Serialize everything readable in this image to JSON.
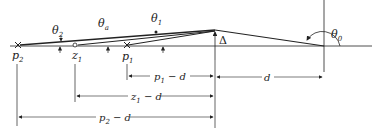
{
  "diagram": {
    "points": {
      "p2": {
        "label": "p",
        "sub": "2"
      },
      "z1": {
        "label": "z",
        "sub": "1"
      },
      "p1": {
        "label": "p",
        "sub": "1"
      }
    },
    "angles": {
      "theta2": {
        "label": "θ",
        "sub": "2"
      },
      "theta_a": {
        "label": "θ",
        "sub": "a"
      },
      "theta1": {
        "label": "θ",
        "sub": "1"
      },
      "theta0": {
        "label": "θ",
        "sub": "0"
      }
    },
    "delta_label": "Δ",
    "dimensions": {
      "p1_minus_d": {
        "a": "p",
        "sub": "1",
        "b": " − d"
      },
      "d": "d",
      "z1_minus_d": {
        "a": "z",
        "sub": "1",
        "b": " − d"
      },
      "p2_minus_d": {
        "a": "p",
        "sub": "2",
        "b": " − d"
      }
    },
    "colors": {
      "ink": "#222222",
      "background": "#ffffff"
    }
  }
}
